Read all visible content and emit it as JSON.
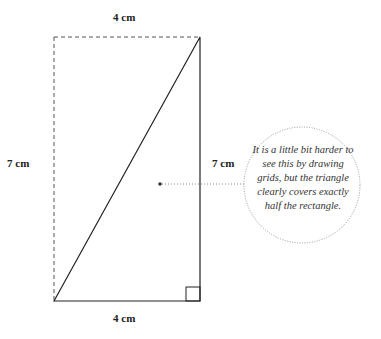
{
  "labels": {
    "top": "4 cm",
    "bottom": "4 cm",
    "left": "7 cm",
    "right": "7 cm"
  },
  "annotation": {
    "text": "It is a little bit harder to see this by drawing grids, but the triangle clearly covers exactly half the rectangle."
  },
  "colors": {
    "stroke": "#222222",
    "dashed": "#555555",
    "dotted": "#888888"
  }
}
